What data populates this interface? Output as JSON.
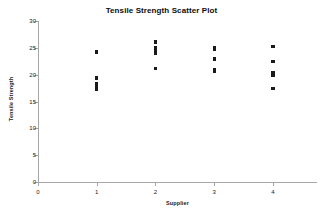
{
  "chart_data": {
    "type": "scatter",
    "title": "Tensile Strength Scatter Plot",
    "xlabel": "Supplier",
    "ylabel": "Tensile Strength",
    "xlim": [
      0,
      4.75
    ],
    "ylim": [
      0,
      30
    ],
    "xticks": [
      0,
      1,
      2,
      3,
      4
    ],
    "yticks": [
      0,
      5,
      10,
      15,
      20,
      25,
      30
    ],
    "grid": false,
    "legend": null,
    "marker_color": "#1a1a1a",
    "axis_color": "#a6a6a6",
    "series": [
      {
        "name": "Tensile Strength by Supplier",
        "points": [
          {
            "x": 1,
            "y": 24.2
          },
          {
            "x": 1,
            "y": 19.4
          },
          {
            "x": 1,
            "y": 18.3
          },
          {
            "x": 1,
            "y": 17.9
          },
          {
            "x": 1,
            "y": 17.3
          },
          {
            "x": 2,
            "y": 26.1
          },
          {
            "x": 2,
            "y": 25.1
          },
          {
            "x": 2,
            "y": 24.4
          },
          {
            "x": 2,
            "y": 23.9
          },
          {
            "x": 2,
            "y": 21.2
          },
          {
            "x": 3,
            "y": 25.0
          },
          {
            "x": 3,
            "y": 24.7
          },
          {
            "x": 3,
            "y": 22.9
          },
          {
            "x": 3,
            "y": 20.9
          },
          {
            "x": 3,
            "y": 20.6
          },
          {
            "x": 4,
            "y": 25.2
          },
          {
            "x": 4,
            "y": 22.5
          },
          {
            "x": 4,
            "y": 20.3
          },
          {
            "x": 4,
            "y": 19.9
          },
          {
            "x": 4,
            "y": 17.4
          }
        ]
      }
    ]
  }
}
